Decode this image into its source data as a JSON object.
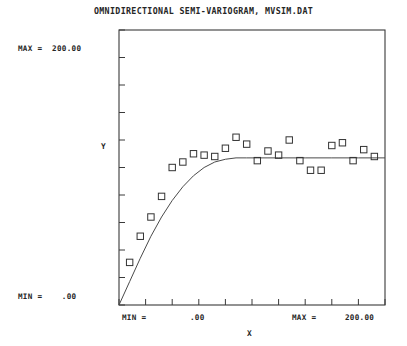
{
  "header": {
    "title": "OMNIDIRECTIONAL SEMI-VARIOGRAM, MVSIM.DAT"
  },
  "axes": {
    "y_max_label": "MAX =  200.00",
    "y_min_label": "MIN =    .00",
    "x_min_label": "MIN =",
    "x_min_value": ".00",
    "x_max_label": "MAX =",
    "x_max_value": "200.00",
    "x_title": "X",
    "y_title": "Y"
  },
  "chart_data": {
    "type": "scatter",
    "title": "OMNIDIRECTIONAL SEMI-VARIOGRAM, MVSIM.DAT",
    "xlabel": "X",
    "ylabel": "Y",
    "xlim": [
      0,
      200
    ],
    "ylim": [
      0,
      200
    ],
    "grid": false,
    "legend": null,
    "x_ticks": [
      0,
      20,
      40,
      60,
      80,
      100,
      120,
      140,
      160,
      180,
      200
    ],
    "y_ticks": [
      0,
      20,
      40,
      60,
      80,
      100,
      120,
      140,
      160,
      180,
      200
    ],
    "series": [
      {
        "name": "experimental semi-variogram",
        "marker": "open-square",
        "x": [
          8,
          16,
          24,
          32,
          40,
          48,
          56,
          64,
          72,
          80,
          88,
          96,
          104,
          112,
          120,
          128,
          136,
          144,
          152,
          160,
          168,
          176,
          184,
          192
        ],
        "y": [
          31,
          50,
          64,
          79,
          100,
          104,
          110,
          109,
          108,
          114,
          122,
          117,
          105,
          112,
          109,
          120,
          105,
          98,
          98,
          116,
          118,
          105,
          113,
          108
        ]
      },
      {
        "name": "fitted spherical model",
        "marker": "line",
        "x": [
          0,
          8,
          16,
          24,
          32,
          40,
          48,
          56,
          64,
          72,
          80,
          88,
          96,
          104,
          112,
          120,
          140,
          160,
          180,
          200
        ],
        "y": [
          0,
          17,
          34,
          50,
          64,
          76,
          86,
          94,
          100,
          104,
          106,
          107,
          107,
          107,
          107,
          107,
          107,
          107,
          107,
          107
        ]
      }
    ]
  },
  "plot_geometry": {
    "frame_left": 119,
    "frame_right": 385,
    "frame_top": 30,
    "frame_bottom": 305
  }
}
